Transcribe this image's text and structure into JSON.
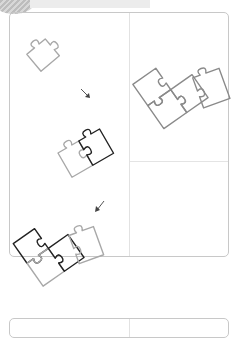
{
  "header": {
    "title": "",
    "accent_color": "#bdbdbd"
  },
  "illustration": {
    "description": "Puzzle piece assembly steps",
    "steps": [
      {
        "id": 1,
        "label": "single piece",
        "icon": "puzzle-piece-icon"
      },
      {
        "id": 2,
        "label": "two pieces joined",
        "icon": "puzzle-pair-icon"
      },
      {
        "id": 3,
        "label": "three pieces joined",
        "icon": "puzzle-trio-icon"
      },
      {
        "id": 4,
        "label": "four pieces assembled",
        "icon": "puzzle-group-icon"
      }
    ],
    "arrows": [
      "arrow-down-right-icon",
      "arrow-down-left-icon"
    ],
    "colors": {
      "light_stroke": "#a8a8a8",
      "dark_stroke": "#222222"
    }
  }
}
